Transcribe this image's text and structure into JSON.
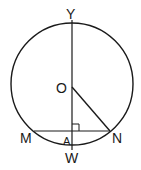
{
  "diagram": {
    "type": "circle-geometry",
    "labels": {
      "Y": "Y",
      "O": "O",
      "M": "M",
      "A": "A",
      "W": "W",
      "N": "N"
    },
    "stroke_color": "#1a1a1a"
  }
}
